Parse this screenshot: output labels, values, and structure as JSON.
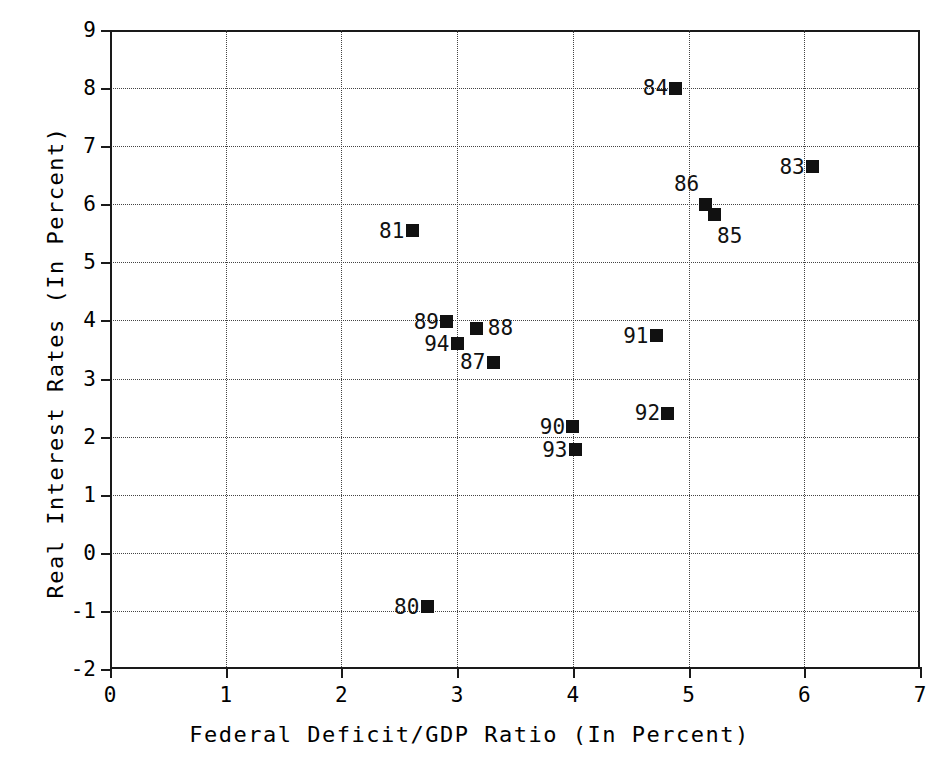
{
  "chart_data": {
    "type": "scatter",
    "title": "",
    "xlabel": "Federal Deficit/GDP Ratio (In Percent)",
    "ylabel": "Real Interest Rates  (In Percent)",
    "xlim": [
      0,
      7
    ],
    "ylim": [
      -2,
      9
    ],
    "xticks": [
      "0",
      "1",
      "2",
      "3",
      "4",
      "5",
      "6",
      "7"
    ],
    "yticks": [
      "9",
      "8",
      "7",
      "6",
      "5",
      "4",
      "3",
      "2",
      "1",
      "0",
      "-1",
      "-2"
    ],
    "grid": true,
    "legend": "none",
    "marker_color": "#111111",
    "points": [
      {
        "label": "80",
        "x": 2.74,
        "y": -0.93,
        "label_pos": "left"
      },
      {
        "label": "81",
        "x": 2.61,
        "y": 5.54,
        "label_pos": "left"
      },
      {
        "label": "83",
        "x": 6.07,
        "y": 6.65,
        "label_pos": "left"
      },
      {
        "label": "84",
        "x": 4.89,
        "y": 8.0,
        "label_pos": "left"
      },
      {
        "label": "85",
        "x": 5.22,
        "y": 5.83,
        "label_pos": "below-right"
      },
      {
        "label": "86",
        "x": 5.15,
        "y": 6.0,
        "label_pos": "above-left"
      },
      {
        "label": "87",
        "x": 3.31,
        "y": 3.28,
        "label_pos": "left"
      },
      {
        "label": "88",
        "x": 3.17,
        "y": 3.87,
        "label_pos": "right"
      },
      {
        "label": "89",
        "x": 2.91,
        "y": 3.98,
        "label_pos": "left"
      },
      {
        "label": "90",
        "x": 4.0,
        "y": 2.17,
        "label_pos": "left"
      },
      {
        "label": "91",
        "x": 4.72,
        "y": 3.74,
        "label_pos": "left"
      },
      {
        "label": "92",
        "x": 4.82,
        "y": 2.4,
        "label_pos": "left"
      },
      {
        "label": "93",
        "x": 4.02,
        "y": 1.77,
        "label_pos": "left"
      },
      {
        "label": "94",
        "x": 3.0,
        "y": 3.6,
        "label_pos": "left"
      }
    ]
  }
}
